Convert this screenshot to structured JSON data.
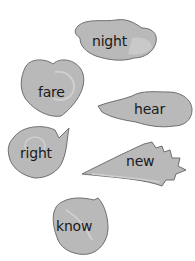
{
  "colors": {
    "shell_fill": "#b9b9b9",
    "shell_stroke": "#6e6e6e",
    "shell_highlight": "#cfcfcf",
    "text": "#1a1a1a",
    "background": "#ffffff"
  },
  "shells": [
    {
      "id": "night",
      "word": "night",
      "shape": "conch-top"
    },
    {
      "id": "fare",
      "word": "fare",
      "shape": "nautilus-heart"
    },
    {
      "id": "hear",
      "word": "hear",
      "shape": "whelk"
    },
    {
      "id": "right",
      "word": "right",
      "shape": "snail-spiral"
    },
    {
      "id": "new",
      "word": "new",
      "shape": "spiky-cone"
    },
    {
      "id": "know",
      "word": "know",
      "shape": "clam-round"
    }
  ]
}
